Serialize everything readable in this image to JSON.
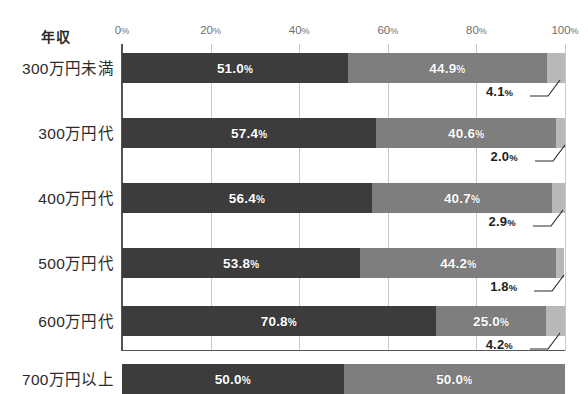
{
  "chart_data": {
    "type": "bar",
    "subtype": "stacked-horizontal-100",
    "title": "",
    "xlabel": "",
    "ylabel": "年収",
    "categories": [
      "300万円未満",
      "300万円代",
      "400万円代",
      "500万円代",
      "600万円代",
      "700万円以上"
    ],
    "xlim": [
      0,
      100
    ],
    "x_ticks": [
      0,
      20,
      40,
      60,
      80,
      100
    ],
    "x_tick_labels": [
      "0%",
      "20%",
      "40%",
      "60%",
      "80%",
      "100%"
    ],
    "grid": true,
    "legend": "none",
    "series": [
      {
        "name": "segment-1",
        "color": "#3c3c3c",
        "values": [
          51.0,
          57.4,
          56.4,
          53.8,
          70.8,
          50.0
        ]
      },
      {
        "name": "segment-2",
        "color": "#7e7e7e",
        "values": [
          44.9,
          40.6,
          40.7,
          44.2,
          25.0,
          50.0
        ]
      },
      {
        "name": "segment-3",
        "color": "#b8b8b8",
        "values": [
          4.1,
          2.0,
          2.9,
          1.8,
          4.2,
          null
        ]
      }
    ],
    "value_labels": {
      "segment_1": [
        "51.0",
        "57.4",
        "56.4",
        "53.8",
        "70.8",
        "50.0"
      ],
      "segment_2": [
        "44.9",
        "40.6",
        "40.7",
        "44.2",
        "25.0",
        "50.0"
      ],
      "segment_3": [
        "4.1",
        "2.0",
        "2.9",
        "1.8",
        "4.2",
        null
      ]
    },
    "percent_suffix": "%"
  },
  "axis": {
    "y_title": "年収",
    "ticks": [
      {
        "label_number": "0",
        "suffix": "%",
        "value": 0
      },
      {
        "label_number": "20",
        "suffix": "%",
        "value": 20
      },
      {
        "label_number": "40",
        "suffix": "%",
        "value": 40
      },
      {
        "label_number": "60",
        "suffix": "%",
        "value": 60
      },
      {
        "label_number": "80",
        "suffix": "%",
        "value": 80
      },
      {
        "label_number": "100",
        "suffix": "%",
        "value": 100
      }
    ]
  },
  "rows": [
    {
      "category": "300万円未満",
      "segments": [
        {
          "name": "seg-1",
          "value": 51.0,
          "label": "51.0",
          "suffix": "%",
          "color": "#3c3c3c"
        },
        {
          "name": "seg-2",
          "value": 44.9,
          "label": "44.9",
          "suffix": "%",
          "color": "#7e7e7e"
        },
        {
          "name": "seg-3",
          "value": 4.1,
          "label": "4.1",
          "suffix": "%",
          "color": "#b8b8b8"
        }
      ],
      "callout": {
        "label": "4.1",
        "suffix": "%"
      }
    },
    {
      "category": "300万円代",
      "segments": [
        {
          "name": "seg-1",
          "value": 57.4,
          "label": "57.4",
          "suffix": "%",
          "color": "#3c3c3c"
        },
        {
          "name": "seg-2",
          "value": 40.6,
          "label": "40.6",
          "suffix": "%",
          "color": "#7e7e7e"
        },
        {
          "name": "seg-3",
          "value": 2.0,
          "label": "2.0",
          "suffix": "%",
          "color": "#b8b8b8"
        }
      ],
      "callout": {
        "label": "2.0",
        "suffix": "%"
      }
    },
    {
      "category": "400万円代",
      "segments": [
        {
          "name": "seg-1",
          "value": 56.4,
          "label": "56.4",
          "suffix": "%",
          "color": "#3c3c3c"
        },
        {
          "name": "seg-2",
          "value": 40.7,
          "label": "40.7",
          "suffix": "%",
          "color": "#7e7e7e"
        },
        {
          "name": "seg-3",
          "value": 2.9,
          "label": "2.9",
          "suffix": "%",
          "color": "#b8b8b8"
        }
      ],
      "callout": {
        "label": "2.9",
        "suffix": "%"
      }
    },
    {
      "category": "500万円代",
      "segments": [
        {
          "name": "seg-1",
          "value": 53.8,
          "label": "53.8",
          "suffix": "%",
          "color": "#3c3c3c"
        },
        {
          "name": "seg-2",
          "value": 44.2,
          "label": "44.2",
          "suffix": "%",
          "color": "#7e7e7e"
        },
        {
          "name": "seg-3",
          "value": 1.8,
          "label": "1.8",
          "suffix": "%",
          "color": "#b8b8b8"
        }
      ],
      "callout": {
        "label": "1.8",
        "suffix": "%"
      }
    },
    {
      "category": "600万円代",
      "segments": [
        {
          "name": "seg-1",
          "value": 70.8,
          "label": "70.8",
          "suffix": "%",
          "color": "#3c3c3c"
        },
        {
          "name": "seg-2",
          "value": 25.0,
          "label": "25.0",
          "suffix": "%",
          "color": "#7e7e7e"
        },
        {
          "name": "seg-3",
          "value": 4.2,
          "label": "4.2",
          "suffix": "%",
          "color": "#b8b8b8"
        }
      ],
      "callout": {
        "label": "4.2",
        "suffix": "%"
      }
    },
    {
      "category": "700万円以上",
      "segments": [
        {
          "name": "seg-1",
          "value": 50.0,
          "label": "50.0",
          "suffix": "%",
          "color": "#3c3c3c"
        },
        {
          "name": "seg-2",
          "value": 50.0,
          "label": "50.0",
          "suffix": "%",
          "color": "#7e7e7e"
        }
      ],
      "callout": null
    }
  ],
  "colors": {
    "segment_1": "#3c3c3c",
    "segment_2": "#7e7e7e",
    "segment_3": "#b8b8b8",
    "gridline": "#c9c9c9",
    "axis": "#555555",
    "text": "#2b2b2b",
    "tick_text": "#6f6f6f",
    "background": "#ffffff"
  }
}
